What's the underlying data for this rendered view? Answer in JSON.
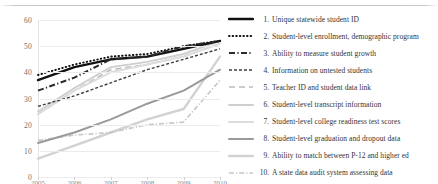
{
  "chart_data": {
    "type": "line",
    "title": "",
    "xlabel": "",
    "ylabel": "",
    "ylim": [
      0,
      60
    ],
    "yticks": [
      0,
      10,
      20,
      30,
      40,
      50,
      60
    ],
    "grid": true,
    "legend_position": "right",
    "x": [
      "2005",
      "2006",
      "2007",
      "2008",
      "2009",
      "2010"
    ],
    "xticks_visible": false,
    "series": [
      {
        "name": "Unique statewide student ID",
        "number": "1.",
        "style": "solid-thick",
        "color": "#111111",
        "values": [
          37,
          42,
          45,
          46,
          49,
          52
        ]
      },
      {
        "name": "Student-level enrollment, demographic program",
        "number": "2.",
        "style": "dotted",
        "color": "#111111",
        "values": [
          39,
          43,
          46,
          47,
          50,
          52
        ]
      },
      {
        "name": "Ability to measure student growth",
        "number": "3.",
        "style": "dash-dot",
        "color": "#2b2b2b",
        "values": [
          33,
          38,
          45,
          46,
          50,
          52
        ]
      },
      {
        "name": "Information on untested students",
        "number": "4.",
        "style": "dashed-fine",
        "color": "#3d3d3d",
        "values": [
          27,
          31,
          36,
          41,
          45,
          49
        ]
      },
      {
        "name": "Teacher ID and student data link",
        "number": "5.",
        "style": "dashed-light",
        "color": "#bcbcbc",
        "values": [
          24,
          33,
          41,
          43,
          46,
          51
        ]
      },
      {
        "name": "Student-level transcript information",
        "number": "6.",
        "style": "solid-light",
        "color": "#cfcfcf",
        "values": [
          25,
          34,
          42,
          44,
          47,
          52
        ]
      },
      {
        "name": "Student-level college readiness test scores",
        "number": "7.",
        "style": "solid-lighter",
        "color": "#dcdcdc",
        "values": [
          24,
          33,
          40,
          43,
          46,
          51
        ]
      },
      {
        "name": "Student-level graduation and dropout data",
        "number": "8.",
        "style": "solid-mid",
        "color": "#9a9a9a",
        "values": [
          13,
          17,
          22,
          28,
          33,
          41
        ]
      },
      {
        "name": "Ability to match between P-12 and higher ed",
        "number": "9.",
        "style": "solid-pale",
        "color": "#d2d2d2",
        "values": [
          7,
          12,
          17,
          22,
          26,
          46
        ]
      },
      {
        "name": "A state data audit system assessing data",
        "number": "10.",
        "style": "dash-dot-pale",
        "color": "#c6c6c6",
        "values": [
          14,
          16,
          17,
          20,
          21,
          37
        ]
      }
    ]
  }
}
